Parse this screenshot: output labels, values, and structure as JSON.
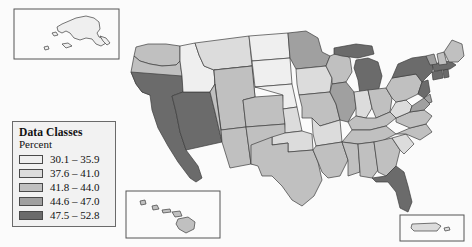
{
  "map": {
    "title": "United States choropleth map",
    "background_color": "#fbfbfb",
    "border_color": "#3d3d3d",
    "insets": [
      {
        "name": "alaska-inset",
        "label": "Alaska"
      },
      {
        "name": "hawaii-inset",
        "label": "Hawaii"
      },
      {
        "name": "puerto-rico-inset",
        "label": "Puerto Rico"
      }
    ]
  },
  "legend": {
    "title": "Data Classes",
    "subtitle": "Percent",
    "classes": [
      {
        "label": "30.1 – 35.9",
        "color": "#efefef",
        "min": 30.1,
        "max": 35.9
      },
      {
        "label": "37.6 – 41.0",
        "color": "#dcdcdc",
        "min": 37.6,
        "max": 41.0
      },
      {
        "label": "41.8 – 44.0",
        "color": "#c0c0c0",
        "min": 41.8,
        "max": 44.0
      },
      {
        "label": "44.6 – 47.0",
        "color": "#a0a0a0",
        "min": 44.6,
        "max": 47.0
      },
      {
        "label": "47.5 – 52.8",
        "color": "#6b6b6b",
        "min": 47.5,
        "max": 52.8
      }
    ]
  },
  "chart_data": {
    "type": "heatmap",
    "title": "Data Classes",
    "subtitle": "Percent",
    "legend_position": "bottom-left",
    "categories": [
      "30.1 – 35.9",
      "37.6 – 41.0",
      "41.8 – 44.0",
      "44.6 – 47.0",
      "47.5 – 52.8"
    ],
    "colors": [
      "#efefef",
      "#dcdcdc",
      "#c0c0c0",
      "#a0a0a0",
      "#6b6b6b"
    ],
    "states": [
      {
        "name": "Washington",
        "abbr": "WA",
        "class": 3
      },
      {
        "name": "Oregon",
        "abbr": "OR",
        "class": 3
      },
      {
        "name": "California",
        "abbr": "CA",
        "class": 5
      },
      {
        "name": "Nevada",
        "abbr": "NV",
        "class": 5
      },
      {
        "name": "Idaho",
        "abbr": "ID",
        "class": 1
      },
      {
        "name": "Montana",
        "abbr": "MT",
        "class": 2
      },
      {
        "name": "Wyoming",
        "abbr": "WY",
        "class": 1
      },
      {
        "name": "Utah",
        "abbr": "UT",
        "class": 3
      },
      {
        "name": "Arizona",
        "abbr": "AZ",
        "class": 3
      },
      {
        "name": "Colorado",
        "abbr": "CO",
        "class": 3
      },
      {
        "name": "New Mexico",
        "abbr": "NM",
        "class": 3
      },
      {
        "name": "North Dakota",
        "abbr": "ND",
        "class": 1
      },
      {
        "name": "South Dakota",
        "abbr": "SD",
        "class": 1
      },
      {
        "name": "Nebraska",
        "abbr": "NE",
        "class": 1
      },
      {
        "name": "Kansas",
        "abbr": "KS",
        "class": 2
      },
      {
        "name": "Oklahoma",
        "abbr": "OK",
        "class": 2
      },
      {
        "name": "Texas",
        "abbr": "TX",
        "class": 3
      },
      {
        "name": "Minnesota",
        "abbr": "MN",
        "class": 4
      },
      {
        "name": "Iowa",
        "abbr": "IA",
        "class": 2
      },
      {
        "name": "Missouri",
        "abbr": "MO",
        "class": 3
      },
      {
        "name": "Arkansas",
        "abbr": "AR",
        "class": 2
      },
      {
        "name": "Louisiana",
        "abbr": "LA",
        "class": 3
      },
      {
        "name": "Wisconsin",
        "abbr": "WI",
        "class": 3
      },
      {
        "name": "Illinois",
        "abbr": "IL",
        "class": 4
      },
      {
        "name": "Michigan",
        "abbr": "MI",
        "class": 5
      },
      {
        "name": "Indiana",
        "abbr": "IN",
        "class": 2
      },
      {
        "name": "Ohio",
        "abbr": "OH",
        "class": 3
      },
      {
        "name": "Kentucky",
        "abbr": "KY",
        "class": 3
      },
      {
        "name": "Tennessee",
        "abbr": "TN",
        "class": 3
      },
      {
        "name": "Mississippi",
        "abbr": "MS",
        "class": 3
      },
      {
        "name": "Alabama",
        "abbr": "AL",
        "class": 3
      },
      {
        "name": "Georgia",
        "abbr": "GA",
        "class": 3
      },
      {
        "name": "Florida",
        "abbr": "FL",
        "class": 5
      },
      {
        "name": "South Carolina",
        "abbr": "SC",
        "class": 2
      },
      {
        "name": "North Carolina",
        "abbr": "NC",
        "class": 3
      },
      {
        "name": "Virginia",
        "abbr": "VA",
        "class": 3
      },
      {
        "name": "West Virginia",
        "abbr": "WV",
        "class": 2
      },
      {
        "name": "Pennsylvania",
        "abbr": "PA",
        "class": 3
      },
      {
        "name": "New York",
        "abbr": "NY",
        "class": 5
      },
      {
        "name": "Maryland",
        "abbr": "MD",
        "class": 4
      },
      {
        "name": "Delaware",
        "abbr": "DE",
        "class": 4
      },
      {
        "name": "New Jersey",
        "abbr": "NJ",
        "class": 5
      },
      {
        "name": "Connecticut",
        "abbr": "CT",
        "class": 5
      },
      {
        "name": "Rhode Island",
        "abbr": "RI",
        "class": 5
      },
      {
        "name": "Massachusetts",
        "abbr": "MA",
        "class": 5
      },
      {
        "name": "Vermont",
        "abbr": "VT",
        "class": 4
      },
      {
        "name": "New Hampshire",
        "abbr": "NH",
        "class": 3
      },
      {
        "name": "Maine",
        "abbr": "ME",
        "class": 3
      },
      {
        "name": "Alaska",
        "abbr": "AK",
        "class": 2
      },
      {
        "name": "Hawaii",
        "abbr": "HI",
        "class": 3
      },
      {
        "name": "Puerto Rico",
        "abbr": "PR",
        "class": 2
      }
    ]
  }
}
